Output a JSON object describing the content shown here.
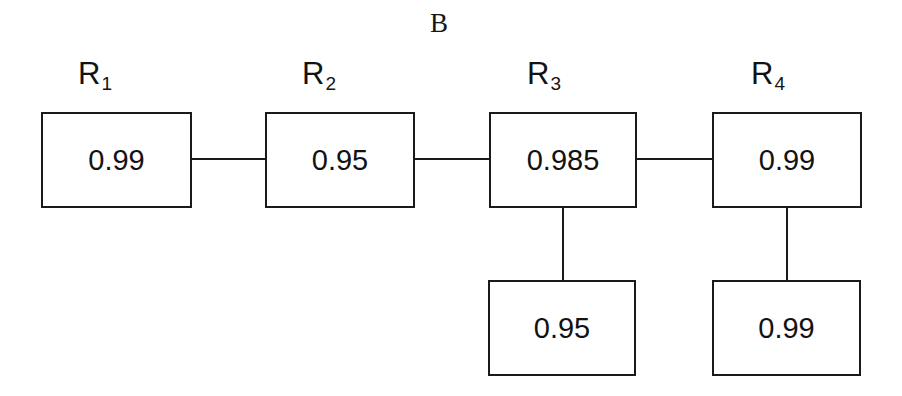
{
  "diagram": {
    "title": "B",
    "type": "reliability-block-diagram",
    "top_blocks": [
      {
        "label_base": "R",
        "label_sub": "1",
        "value": "0.99"
      },
      {
        "label_base": "R",
        "label_sub": "2",
        "value": "0.95"
      },
      {
        "label_base": "R",
        "label_sub": "3",
        "value": "0.985"
      },
      {
        "label_base": "R",
        "label_sub": "4",
        "value": "0.99"
      }
    ],
    "bottom_blocks": [
      {
        "value": "0.95"
      },
      {
        "value": "0.99"
      }
    ],
    "colors": {
      "stroke": "#1a1a1a",
      "text": "#121212",
      "background": "#ffffff"
    }
  }
}
